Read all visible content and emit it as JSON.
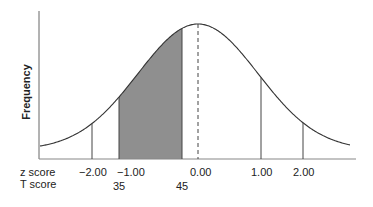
{
  "chart_data": {
    "type": "area",
    "title": "",
    "xlabel": "",
    "ylabel": "Frequency",
    "distribution": {
      "mean_z": 0.0,
      "sd_z": 1.0,
      "mean_T": 50,
      "sd_T": 10
    },
    "shaded_region": {
      "z_from": -1.5,
      "z_to": -0.5,
      "T_from": 35,
      "T_to": 45,
      "color": "#8f8f8f"
    },
    "mean_line": {
      "z": 0.0,
      "style": "dashed"
    },
    "vertical_lines_z": [
      -2.0,
      1.0,
      2.0
    ],
    "z_score_ticks": [
      "−2.00",
      "−1.00",
      "0.00",
      "1.00",
      "2.00"
    ],
    "T_score_ticks": [
      "35",
      "45"
    ],
    "grid": false,
    "legend": null
  },
  "labels": {
    "y_axis": "Frequency",
    "z_row": "z score",
    "t_row": "T score",
    "z_ticks": [
      "−2.00",
      "−1.00",
      "0.00",
      "1.00",
      "2.00"
    ],
    "t_ticks": [
      "35",
      "45"
    ]
  },
  "colors": {
    "curve": "#333333",
    "shade": "#8f8f8f",
    "axis": "#666666"
  }
}
